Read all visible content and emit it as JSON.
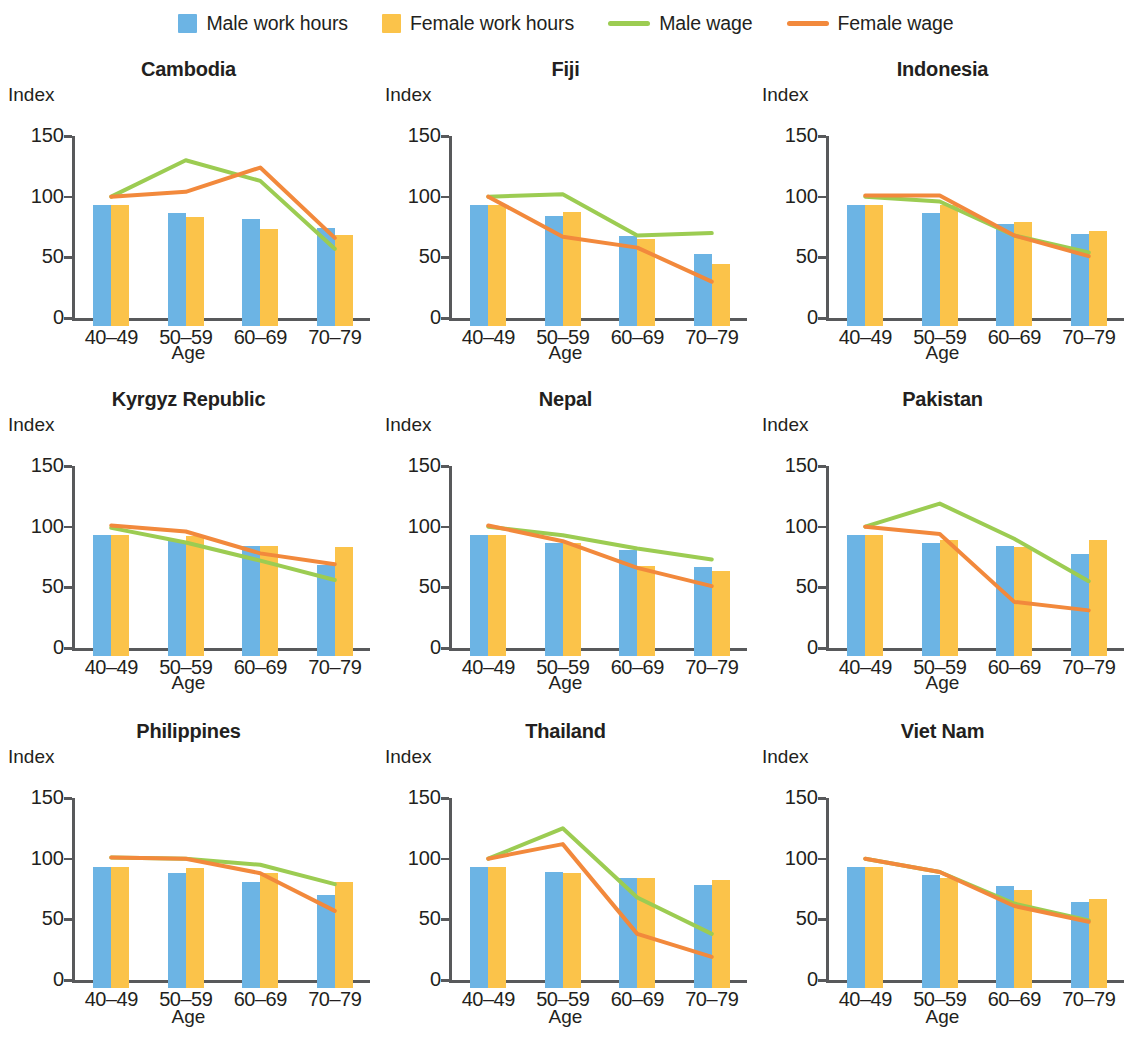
{
  "legend": {
    "items": [
      {
        "label": "Male work hours",
        "kind": "swatch",
        "icon": "square-swatch-icon",
        "color": "#6cb4e4"
      },
      {
        "label": "Female work hours",
        "kind": "swatch",
        "icon": "square-swatch-icon",
        "color": "#fbc34a"
      },
      {
        "label": "Male wage",
        "kind": "line",
        "icon": "line-swatch-icon",
        "color": "#9ccc52"
      },
      {
        "label": "Female wage",
        "kind": "line",
        "icon": "line-swatch-icon",
        "color": "#f2893c"
      }
    ]
  },
  "axes": {
    "y_title": "Index",
    "x_title": "Age",
    "y_ticks": [
      "0",
      "50",
      "100",
      "150"
    ],
    "y_tick_values": [
      0,
      50,
      100,
      150
    ],
    "ylim": [
      0,
      150
    ],
    "x_categories": [
      "40–49",
      "50–59",
      "60–69",
      "70–79"
    ]
  },
  "colors": {
    "male_work_hours": "#6cb4e4",
    "female_work_hours": "#fbc34a",
    "male_wage": "#9ccc52",
    "female_wage": "#f2893c",
    "axis": "#58595b",
    "text": "#231f20",
    "background": "#ffffff"
  },
  "chart_data": [
    {
      "type": "bar",
      "title": "Cambodia",
      "xlabel": "Age",
      "ylabel": "Index",
      "ylim": [
        0,
        150
      ],
      "grid": false,
      "legend_position": "top-center",
      "categories": [
        "40–49",
        "50–59",
        "60–69",
        "70–79"
      ],
      "series": [
        {
          "name": "Male work hours",
          "type": "bar",
          "values": [
            100,
            93,
            88,
            81
          ]
        },
        {
          "name": "Female work hours",
          "type": "bar",
          "values": [
            100,
            90,
            80,
            75
          ]
        },
        {
          "name": "Male wage",
          "type": "line",
          "values": [
            100,
            130,
            113,
            57
          ]
        },
        {
          "name": "Female wage",
          "type": "line",
          "values": [
            100,
            104,
            124,
            66
          ]
        }
      ]
    },
    {
      "type": "bar",
      "title": "Fiji",
      "xlabel": "Age",
      "ylabel": "Index",
      "ylim": [
        0,
        150
      ],
      "grid": false,
      "legend_position": "top-center",
      "categories": [
        "40–49",
        "50–59",
        "60–69",
        "70–79"
      ],
      "series": [
        {
          "name": "Male work hours",
          "type": "bar",
          "values": [
            100,
            91,
            74,
            59
          ]
        },
        {
          "name": "Female work hours",
          "type": "bar",
          "values": [
            100,
            94,
            72,
            51
          ]
        },
        {
          "name": "Male wage",
          "type": "line",
          "values": [
            100,
            102,
            68,
            70
          ]
        },
        {
          "name": "Female wage",
          "type": "line",
          "values": [
            100,
            67,
            58,
            30
          ]
        }
      ]
    },
    {
      "type": "bar",
      "title": "Indonesia",
      "xlabel": "Age",
      "ylabel": "Index",
      "ylim": [
        0,
        150
      ],
      "grid": false,
      "legend_position": "top-center",
      "categories": [
        "40–49",
        "50–59",
        "60–69",
        "70–79"
      ],
      "series": [
        {
          "name": "Male work hours",
          "type": "bar",
          "values": [
            100,
            93,
            84,
            76
          ]
        },
        {
          "name": "Female work hours",
          "type": "bar",
          "values": [
            100,
            100,
            86,
            78
          ]
        },
        {
          "name": "Male wage",
          "type": "line",
          "values": [
            100,
            96,
            68,
            54
          ]
        },
        {
          "name": "Female wage",
          "type": "line",
          "values": [
            101,
            101,
            68,
            51
          ]
        }
      ]
    },
    {
      "type": "bar",
      "title": "Kyrgyz Republic",
      "xlabel": "Age",
      "ylabel": "Index",
      "ylim": [
        0,
        150
      ],
      "grid": false,
      "legend_position": "top-center",
      "categories": [
        "40–49",
        "50–59",
        "60–69",
        "70–79"
      ],
      "series": [
        {
          "name": "Male work hours",
          "type": "bar",
          "values": [
            100,
            95,
            91,
            75
          ]
        },
        {
          "name": "Female work hours",
          "type": "bar",
          "values": [
            100,
            99,
            91,
            90
          ]
        },
        {
          "name": "Male wage",
          "type": "line",
          "values": [
            99,
            87,
            72,
            56
          ]
        },
        {
          "name": "Female wage",
          "type": "line",
          "values": [
            101,
            96,
            78,
            69
          ]
        }
      ]
    },
    {
      "type": "bar",
      "title": "Nepal",
      "xlabel": "Age",
      "ylabel": "Index",
      "ylim": [
        0,
        150
      ],
      "grid": false,
      "legend_position": "top-center",
      "categories": [
        "40–49",
        "50–59",
        "60–69",
        "70–79"
      ],
      "series": [
        {
          "name": "Male work hours",
          "type": "bar",
          "values": [
            100,
            93,
            87,
            73
          ]
        },
        {
          "name": "Female work hours",
          "type": "bar",
          "values": [
            100,
            93,
            74,
            70
          ]
        },
        {
          "name": "Male wage",
          "type": "line",
          "values": [
            100,
            93,
            82,
            73
          ]
        },
        {
          "name": "Female wage",
          "type": "line",
          "values": [
            101,
            88,
            66,
            51
          ]
        }
      ]
    },
    {
      "type": "bar",
      "title": "Pakistan",
      "xlabel": "Age",
      "ylabel": "Index",
      "ylim": [
        0,
        150
      ],
      "grid": false,
      "legend_position": "top-center",
      "categories": [
        "40–49",
        "50–59",
        "60–69",
        "70–79"
      ],
      "series": [
        {
          "name": "Male work hours",
          "type": "bar",
          "values": [
            100,
            93,
            91,
            84
          ]
        },
        {
          "name": "Female work hours",
          "type": "bar",
          "values": [
            100,
            96,
            90,
            96
          ]
        },
        {
          "name": "Male wage",
          "type": "line",
          "values": [
            100,
            119,
            90,
            55
          ]
        },
        {
          "name": "Female wage",
          "type": "line",
          "values": [
            100,
            94,
            38,
            31
          ]
        }
      ]
    },
    {
      "type": "bar",
      "title": "Philippines",
      "xlabel": "Age",
      "ylabel": "Index",
      "ylim": [
        0,
        150
      ],
      "grid": false,
      "legend_position": "top-center",
      "categories": [
        "40–49",
        "50–59",
        "60–69",
        "70–79"
      ],
      "series": [
        {
          "name": "Male work hours",
          "type": "bar",
          "values": [
            100,
            95,
            87,
            77
          ]
        },
        {
          "name": "Female work hours",
          "type": "bar",
          "values": [
            100,
            99,
            95,
            87
          ]
        },
        {
          "name": "Male wage",
          "type": "line",
          "values": [
            101,
            100,
            95,
            79
          ]
        },
        {
          "name": "Female wage",
          "type": "line",
          "values": [
            101,
            100,
            88,
            57
          ]
        }
      ]
    },
    {
      "type": "bar",
      "title": "Thailand",
      "xlabel": "Age",
      "ylabel": "Index",
      "ylim": [
        0,
        150
      ],
      "grid": false,
      "legend_position": "top-center",
      "categories": [
        "40–49",
        "50–59",
        "60–69",
        "70–79"
      ],
      "series": [
        {
          "name": "Male work hours",
          "type": "bar",
          "values": [
            100,
            96,
            91,
            85
          ]
        },
        {
          "name": "Female work hours",
          "type": "bar",
          "values": [
            100,
            95,
            91,
            89
          ]
        },
        {
          "name": "Male wage",
          "type": "line",
          "values": [
            100,
            125,
            68,
            38
          ]
        },
        {
          "name": "Female wage",
          "type": "line",
          "values": [
            100,
            112,
            38,
            19
          ]
        }
      ]
    },
    {
      "type": "bar",
      "title": "Viet Nam",
      "xlabel": "Age",
      "ylabel": "Index",
      "ylim": [
        0,
        150
      ],
      "grid": false,
      "legend_position": "top-center",
      "categories": [
        "40–49",
        "50–59",
        "60–69",
        "70–79"
      ],
      "series": [
        {
          "name": "Male work hours",
          "type": "bar",
          "values": [
            100,
            93,
            84,
            71
          ]
        },
        {
          "name": "Female work hours",
          "type": "bar",
          "values": [
            100,
            91,
            81,
            73
          ]
        },
        {
          "name": "Male wage",
          "type": "line",
          "values": [
            100,
            89,
            63,
            49
          ]
        },
        {
          "name": "Female wage",
          "type": "line",
          "values": [
            100,
            89,
            61,
            48
          ]
        }
      ]
    }
  ]
}
